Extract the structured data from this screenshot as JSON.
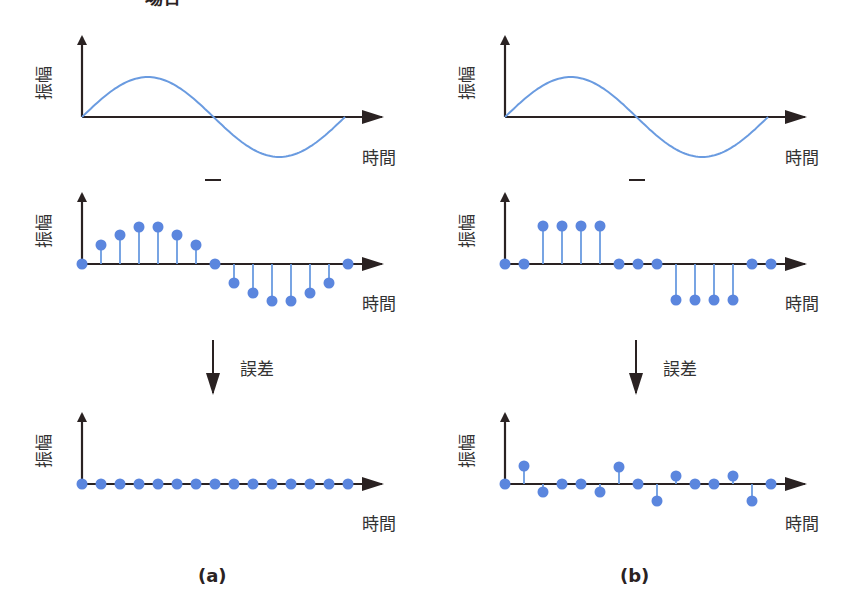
{
  "header": {
    "partial_title": "場合"
  },
  "colors": {
    "axis": "#2a2222",
    "signal": "#6a9be0",
    "dot": "#5b86de",
    "text": "#333333"
  },
  "labels": {
    "y_axis": "振幅",
    "x_axis": "時間",
    "error": "誤差",
    "minus": "−"
  },
  "panels": [
    {
      "id": "a",
      "caption": "(a)",
      "original": {
        "type": "sine",
        "periods": 1
      },
      "sampled_values": [
        0,
        19,
        29,
        37,
        37,
        29,
        19,
        0,
        -19,
        -29,
        -37,
        -37,
        -29,
        -19,
        0
      ],
      "error_values": [
        0,
        0,
        0,
        0,
        0,
        0,
        0,
        0,
        0,
        0,
        0,
        0,
        0,
        0,
        0
      ]
    },
    {
      "id": "b",
      "caption": "(b)",
      "original": {
        "type": "sine",
        "periods": 1
      },
      "sampled_values": [
        0,
        0,
        38,
        38,
        38,
        38,
        0,
        0,
        0,
        -36,
        -36,
        -36,
        -36,
        0,
        0
      ],
      "error_values": [
        0,
        18,
        -8,
        0,
        0,
        -8,
        17,
        0,
        -17,
        8,
        0,
        0,
        8,
        -17,
        0
      ]
    }
  ],
  "chart_data": [
    {
      "type": "line",
      "title": "(a) original signal",
      "xlabel": "時間",
      "ylabel": "振幅",
      "series": [
        {
          "name": "sine",
          "values": "one full sine period"
        }
      ]
    },
    {
      "type": "stem",
      "title": "(a) sampled",
      "xlabel": "時間",
      "ylabel": "振幅",
      "x": [
        0,
        1,
        2,
        3,
        4,
        5,
        6,
        7,
        8,
        9,
        10,
        11,
        12,
        13,
        14
      ],
      "values": [
        0,
        0.5,
        0.78,
        1,
        1,
        0.78,
        0.5,
        0,
        -0.5,
        -0.78,
        -1,
        -1,
        -0.78,
        -0.5,
        0
      ]
    },
    {
      "type": "stem",
      "title": "(a) error",
      "xlabel": "時間",
      "ylabel": "振幅",
      "x": [
        0,
        1,
        2,
        3,
        4,
        5,
        6,
        7,
        8,
        9,
        10,
        11,
        12,
        13,
        14
      ],
      "values": [
        0,
        0,
        0,
        0,
        0,
        0,
        0,
        0,
        0,
        0,
        0,
        0,
        0,
        0,
        0
      ]
    },
    {
      "type": "line",
      "title": "(b) original signal",
      "xlabel": "時間",
      "ylabel": "振幅",
      "series": [
        {
          "name": "sine",
          "values": "one full sine period"
        }
      ]
    },
    {
      "type": "stem",
      "title": "(b) sampled",
      "xlabel": "時間",
      "ylabel": "振幅",
      "x": [
        0,
        1,
        2,
        3,
        4,
        5,
        6,
        7,
        8,
        9,
        10,
        11,
        12,
        13,
        14
      ],
      "values": [
        0,
        0,
        1,
        1,
        1,
        1,
        0,
        0,
        0,
        -1,
        -1,
        -1,
        -1,
        0,
        0
      ]
    },
    {
      "type": "stem",
      "title": "(b) error",
      "xlabel": "時間",
      "ylabel": "振幅",
      "x": [
        0,
        1,
        2,
        3,
        4,
        5,
        6,
        7,
        8,
        9,
        10,
        11,
        12,
        13,
        14
      ],
      "values": [
        0,
        0.5,
        -0.22,
        0,
        0,
        -0.22,
        0.47,
        0,
        -0.47,
        0.22,
        0,
        0,
        0.22,
        -0.47,
        0
      ]
    }
  ]
}
